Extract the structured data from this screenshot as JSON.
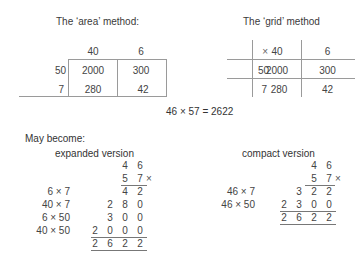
{
  "area_method": {
    "title": "The ‘area’ method:",
    "col_headers": [
      "40",
      "6"
    ],
    "rows": [
      {
        "header": "50",
        "cells": [
          "2000",
          "300"
        ]
      },
      {
        "header": "7",
        "cells": [
          "280",
          "42"
        ]
      }
    ]
  },
  "grid_method": {
    "title": "The ‘grid’ method",
    "corner": "×",
    "col_headers": [
      "40",
      "6"
    ],
    "rows": [
      {
        "header": "50",
        "cells": [
          "2000",
          "300"
        ]
      },
      {
        "header": "7",
        "cells": [
          "280",
          "42"
        ]
      }
    ]
  },
  "equation": "46 × 57 = 2622",
  "may_become": "May become:",
  "expanded": {
    "title": "expanded version",
    "multiplicand": [
      "4",
      "6"
    ],
    "multiplier": [
      "5",
      "7"
    ],
    "times_sign": "×",
    "partials": [
      {
        "label": "6 × 7",
        "digits": [
          "4",
          "2"
        ]
      },
      {
        "label": "40 × 7",
        "digits": [
          "2",
          "8",
          "0"
        ]
      },
      {
        "label": "6 × 50",
        "digits": [
          "3",
          "0",
          "0"
        ]
      },
      {
        "label": "40 × 50",
        "digits": [
          "2",
          "0",
          "0",
          "0"
        ]
      }
    ],
    "total": [
      "2",
      "6",
      "2",
      "2"
    ]
  },
  "compact": {
    "title": "compact version",
    "multiplicand": [
      "4",
      "6"
    ],
    "multiplier": [
      "5",
      "7"
    ],
    "times_sign": "×",
    "partials": [
      {
        "label": "46 × 7",
        "digits": [
          "3",
          "2",
          "2"
        ]
      },
      {
        "label": "46 × 50",
        "digits": [
          "2",
          "3",
          "0",
          "0"
        ]
      }
    ],
    "total": [
      "2",
      "6",
      "2",
      "2"
    ]
  }
}
